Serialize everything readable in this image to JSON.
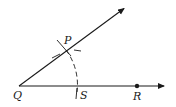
{
  "diagram": {
    "points": {
      "Q": {
        "label": "Q",
        "x": 19,
        "y": 86
      },
      "P": {
        "label": "P",
        "x": 66,
        "y": 50
      },
      "S": {
        "label": "S",
        "x": 77,
        "y": 86
      },
      "R": {
        "label": "R",
        "x": 137,
        "y": 86
      }
    },
    "rays": [
      {
        "name": "ray-QR",
        "from": "Q",
        "to": [
          166,
          86
        ]
      },
      {
        "name": "ray-QP",
        "from": "Q",
        "to": [
          126,
          7
        ]
      }
    ],
    "colors": {
      "stroke": "#1a1a1a",
      "background": "#ffffff"
    }
  }
}
